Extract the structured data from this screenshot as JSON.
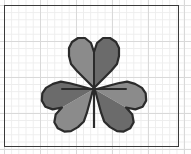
{
  "document": {
    "title": "Clover Leaf Sketch",
    "surface": "graph-paper",
    "frame_label": "sheet-border"
  },
  "paper": {
    "background_color": "#ffffff",
    "minor_grid_color": "#ededed",
    "major_grid_color": "#d9d9d9",
    "minor_grid_spacing_px": 7.2,
    "major_grid_spacing_px": 36,
    "frame_color": "#3a3a3a",
    "frame_x": 4,
    "frame_y": 5,
    "frame_width": 175,
    "frame_height": 142
  },
  "figure": {
    "name": "three-leaf-clover",
    "outline_color": "#2b2b2b",
    "outline_width": 2,
    "fill_light": "#8b8b8b",
    "fill_dark": "#6b6b6b",
    "center_x": 94,
    "center_y": 89,
    "leaf_count": 3,
    "leaves": [
      {
        "name": "top-leaf",
        "position": "top",
        "shape": "heart",
        "light_half_color": "#8b8b8b",
        "dark_half_color": "#6b6b6b",
        "rotation_deg": 0
      },
      {
        "name": "left-leaf",
        "position": "left",
        "shape": "heart",
        "light_half_color": "#8b8b8b",
        "dark_half_color": "#6b6b6b",
        "rotation_deg": -120
      },
      {
        "name": "right-leaf",
        "position": "right",
        "shape": "heart",
        "light_half_color": "#8b8b8b",
        "dark_half_color": "#6b6b6b",
        "rotation_deg": 120
      }
    ],
    "stem": {
      "name": "stem",
      "color": "#2b2b2b",
      "width_px": 2,
      "top_y": 89,
      "bottom_y": 128,
      "x": 94
    },
    "veins": [
      {
        "name": "vein-top",
        "from": [
          94,
          89
        ],
        "to": [
          94,
          52
        ]
      },
      {
        "name": "vein-left",
        "from": [
          94,
          89
        ],
        "to": [
          62,
          89
        ]
      },
      {
        "name": "vein-right",
        "from": [
          94,
          89
        ],
        "to": [
          126,
          89
        ]
      }
    ]
  }
}
